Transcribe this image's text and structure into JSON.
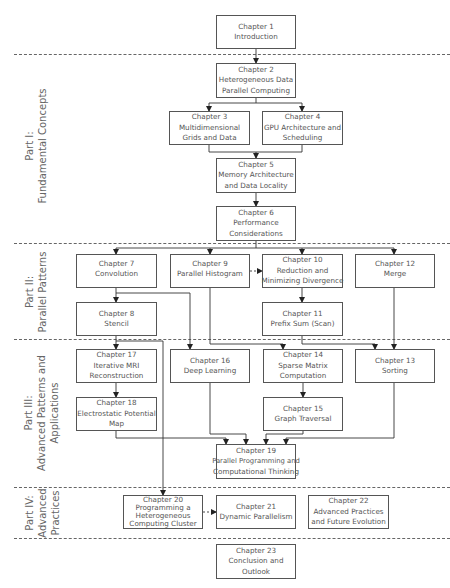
{
  "parts": [
    {
      "id": "part1",
      "line1": "Part I:",
      "line2": "Fundamental Concepts"
    },
    {
      "id": "part2",
      "line1": "Part II:",
      "line2": "Parallel Patterns"
    },
    {
      "id": "part3",
      "line1": "Part III:",
      "line2": "Advanced Patterns and",
      "line3": "Applications"
    },
    {
      "id": "part4",
      "line1": "Part IV:",
      "line2": "Advanced",
      "line3": "Practices"
    }
  ],
  "chapters": {
    "ch1": {
      "number": "Chapter 1",
      "title": [
        "Introduction"
      ]
    },
    "ch2": {
      "number": "Chapter 2",
      "title": [
        "Heterogeneous Data",
        "Parallel Computing"
      ]
    },
    "ch3": {
      "number": "Chapter 3",
      "title": [
        "Multidimensional",
        "Grids and Data"
      ]
    },
    "ch4": {
      "number": "Chapter 4",
      "title": [
        "GPU Architecture and",
        "Scheduling"
      ]
    },
    "ch5": {
      "number": "Chapter 5",
      "title": [
        "Memory Architecture",
        "and Data Locality"
      ]
    },
    "ch6": {
      "number": "Chapter 6",
      "title": [
        "Performance",
        "Considerations"
      ]
    },
    "ch7": {
      "number": "Chapter 7",
      "title": [
        "Convolution"
      ]
    },
    "ch8": {
      "number": "Chapter 8",
      "title": [
        "Stencil"
      ]
    },
    "ch9": {
      "number": "Chapter 9",
      "title": [
        "Parallel Histogram"
      ]
    },
    "ch10": {
      "number": "Chapter 10",
      "title": [
        "Reduction and",
        "Minimizing Divergence"
      ]
    },
    "ch11": {
      "number": "Chapter 11",
      "title": [
        "Prefix Sum (Scan)"
      ]
    },
    "ch12": {
      "number": "Chapter 12",
      "title": [
        "Merge"
      ]
    },
    "ch13": {
      "number": "Chapter 13",
      "title": [
        "Sorting"
      ]
    },
    "ch14": {
      "number": "Chapter 14",
      "title": [
        "Sparse Matrix",
        "Computation"
      ]
    },
    "ch15": {
      "number": "Chapter 15",
      "title": [
        "Graph Traversal"
      ]
    },
    "ch16": {
      "number": "Chapter 16",
      "title": [
        "Deep Learning"
      ]
    },
    "ch17": {
      "number": "Chapter 17",
      "title": [
        "Iterative MRI",
        "Reconstruction"
      ]
    },
    "ch18": {
      "number": "Chapter 18",
      "title": [
        "Electrostatic Potential",
        "Map"
      ]
    },
    "ch19": {
      "number": "Chapter 19",
      "title": [
        "Parallel Programming and",
        "Computational Thinking"
      ]
    },
    "ch20": {
      "number": "Chapter 20",
      "title": [
        "Programming a",
        "Heterogeneous",
        "Computing Cluster"
      ]
    },
    "ch21": {
      "number": "Chapter 21",
      "title": [
        "Dynamic Parallelism"
      ]
    },
    "ch22": {
      "number": "Chapter 22",
      "title": [
        "Advanced Practices",
        "and Future Evolution"
      ]
    },
    "ch23": {
      "number": "Chapter 23",
      "title": [
        "Conclusion and",
        "Outlook"
      ]
    }
  },
  "colors": {
    "line": "#333333",
    "box_border": "#555555",
    "text": "#555555",
    "dash": "#666666"
  }
}
